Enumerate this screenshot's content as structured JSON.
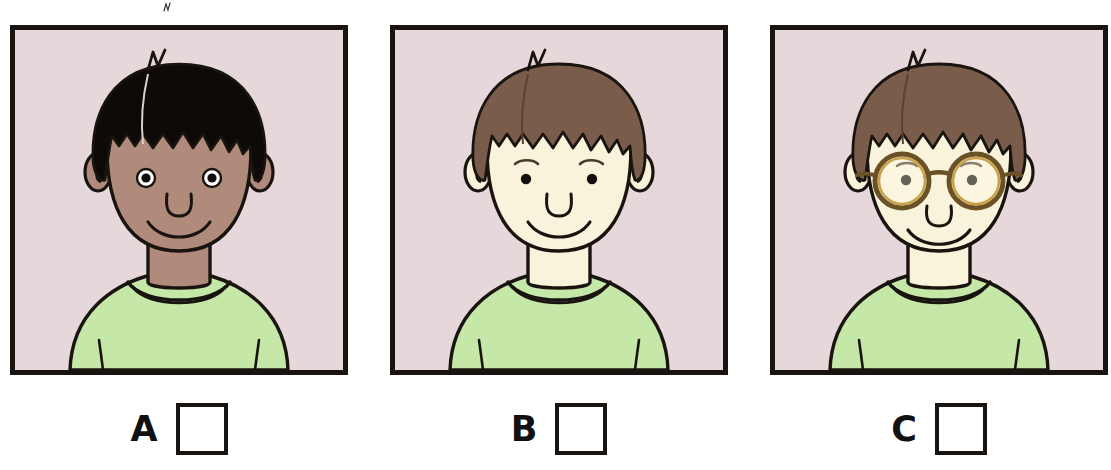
{
  "worksheet": {
    "title": "Character identification multiple choice",
    "instruction_visible": false,
    "option_count": 3
  },
  "options": [
    {
      "id": "a",
      "letter": "A",
      "checkbox_state": "unchecked",
      "portrait": {
        "alt": "Boy with black hair, dark brown skin, green t-shirt",
        "skin_tone": "#b08a7a",
        "hair_color": "#0d0a08",
        "shirt_color": "#c5e8a8",
        "background_color": "#e6d7da",
        "has_glasses": false,
        "eye_style": "white-sclera",
        "expression": "smiling"
      }
    },
    {
      "id": "b",
      "letter": "B",
      "checkbox_state": "unchecked",
      "portrait": {
        "alt": "Boy with brown hair, pale skin, green t-shirt",
        "skin_tone": "#faf3dc",
        "hair_color": "#7a5c4a",
        "shirt_color": "#c5e8a8",
        "background_color": "#e6d7da",
        "has_glasses": false,
        "eye_style": "solid-dot",
        "expression": "smiling"
      }
    },
    {
      "id": "c",
      "letter": "C",
      "checkbox_state": "unchecked",
      "portrait": {
        "alt": "Boy with brown hair, pale skin, round glasses, green t-shirt",
        "skin_tone": "#faf3dc",
        "hair_color": "#7a5c4a",
        "shirt_color": "#c5e8a8",
        "background_color": "#e6d7da",
        "has_glasses": true,
        "glasses_color": "#6b5226",
        "glasses_highlight": "#c9a24a",
        "eye_style": "solid-dot",
        "expression": "smiling"
      }
    }
  ],
  "colors": {
    "outline": "#1a1410",
    "frame_border": "#1a1410",
    "page_background": "#ffffff",
    "checkbox_fill": "#ffffff",
    "letter_color": "#111111"
  }
}
